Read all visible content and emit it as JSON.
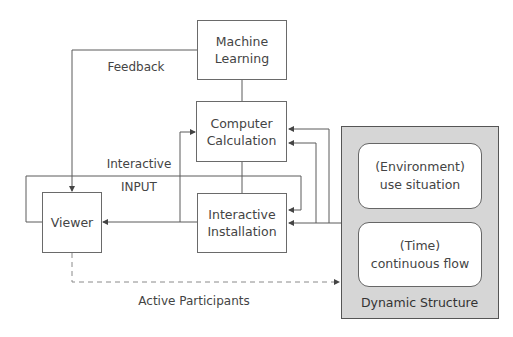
{
  "diagram": {
    "nodes": {
      "machine_learning": {
        "line1": "Machine",
        "line2": "Learning"
      },
      "computer_calculation": {
        "line1": "Computer",
        "line2": "Calculation"
      },
      "interactive_installation": {
        "line1": "Interactive",
        "line2": "Installation"
      },
      "viewer": {
        "label": "Viewer"
      },
      "dynamic_structure": {
        "title": "Dynamic Structure",
        "environment": {
          "line1": "(Environment)",
          "line2": "use situation"
        },
        "time": {
          "line1": "(Time)",
          "line2": "continuous flow"
        }
      }
    },
    "edge_labels": {
      "feedback": "Feedback",
      "interactive": "Interactive",
      "input": "INPUT",
      "active_participants": "Active Participants"
    },
    "edges": [
      {
        "from": "machine_learning",
        "to": "viewer",
        "label": "Feedback",
        "style": "solid"
      },
      {
        "from": "machine_learning",
        "to": "computer_calculation",
        "style": "solid"
      },
      {
        "from": "computer_calculation",
        "to": "interactive_installation",
        "style": "solid"
      },
      {
        "from": "interactive_installation",
        "to": "viewer",
        "style": "solid"
      },
      {
        "from": "viewer",
        "to": "computer_calculation",
        "style": "solid"
      },
      {
        "from": "viewer",
        "to": "interactive_installation",
        "label": "Interactive INPUT",
        "style": "solid"
      },
      {
        "from": "dynamic_structure",
        "to": "computer_calculation",
        "style": "solid",
        "count": 2
      },
      {
        "from": "dynamic_structure",
        "to": "interactive_installation",
        "style": "solid"
      },
      {
        "from": "viewer",
        "to": "dynamic_structure",
        "label": "Active Participants",
        "style": "dashed"
      }
    ],
    "colors": {
      "line": "#5a5a5a",
      "text": "#444444",
      "group_fill": "#d6d6d6",
      "group_border": "#555555",
      "node_fill": "#ffffff"
    }
  }
}
